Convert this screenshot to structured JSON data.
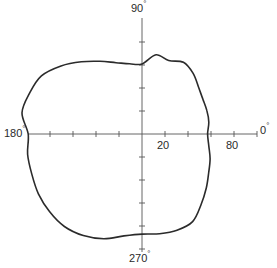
{
  "chart_data": {
    "type": "polar-line",
    "title": "",
    "angle_labels": [
      {
        "angle": 90,
        "text": "90",
        "unit": "°"
      },
      {
        "angle": 180,
        "text": "180",
        "unit": "°"
      },
      {
        "angle": 0,
        "text": "0",
        "unit": "°"
      },
      {
        "angle": 270,
        "text": "270",
        "unit": "°"
      }
    ],
    "radial_tick_labels": [
      {
        "value": 20,
        "text": "20"
      },
      {
        "value": 80,
        "text": "80"
      }
    ],
    "radial_tick_step": 20,
    "radial_ticks_per_half_axis": 5,
    "radial_max": 100,
    "grid": false,
    "line_color": "#2b2b2b",
    "axis_color": "#555555",
    "series": [
      {
        "name": "pattern",
        "points_deg_r": [
          [
            0,
            57
          ],
          [
            10,
            59
          ],
          [
            20,
            60
          ],
          [
            30,
            61
          ],
          [
            40,
            64
          ],
          [
            50,
            69
          ],
          [
            60,
            72
          ],
          [
            70,
            68
          ],
          [
            80,
            70
          ],
          [
            90,
            61
          ],
          [
            100,
            62
          ],
          [
            110,
            66
          ],
          [
            120,
            73
          ],
          [
            130,
            82
          ],
          [
            140,
            92
          ],
          [
            150,
            101
          ],
          [
            160,
            104
          ],
          [
            170,
            106
          ],
          [
            180,
            99
          ],
          [
            190,
            101
          ],
          [
            200,
            102
          ],
          [
            210,
            104
          ],
          [
            220,
            105
          ],
          [
            230,
            105
          ],
          [
            240,
            102
          ],
          [
            250,
            97
          ],
          [
            260,
            90
          ],
          [
            270,
            87
          ],
          [
            280,
            88
          ],
          [
            290,
            89
          ],
          [
            300,
            88
          ],
          [
            310,
            80
          ],
          [
            320,
            73
          ],
          [
            330,
            67
          ],
          [
            340,
            63
          ],
          [
            350,
            59
          ]
        ]
      }
    ]
  }
}
